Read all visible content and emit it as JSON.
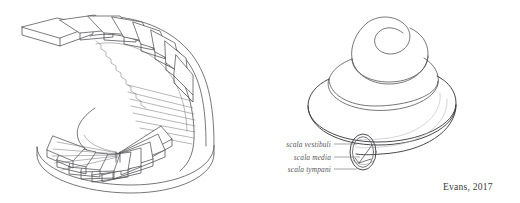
{
  "figure": {
    "type": "scientific-line-illustration",
    "background_color": "#ffffff",
    "line_color": "#4a4a4d",
    "faint_line_color": "#b9b9bd",
    "panels": [
      {
        "id": "spiral-staircase",
        "name": "spiral staircase",
        "position": "left",
        "description": "Isometric line drawing of a helical spiral staircase with wedge-shaped treads winding counterclockwise around an open central well on an elliptical base platform."
      },
      {
        "id": "cochlea",
        "name": "cochlea",
        "position": "right",
        "description": "Isometric line drawing of a cochlea shown as a three-tier conical spiral with a cut-away cross-section at the basal turn."
      }
    ]
  },
  "labels": {
    "color": "#55565a",
    "items": [
      {
        "id": "scala-vestibuli",
        "text": "scala vestibuli"
      },
      {
        "id": "scala-media",
        "text": "scala media"
      },
      {
        "id": "scala-tympani",
        "text": "scala tympani"
      }
    ]
  },
  "credit": {
    "text": "Evans, 2017",
    "color": "#3a3a3c"
  }
}
